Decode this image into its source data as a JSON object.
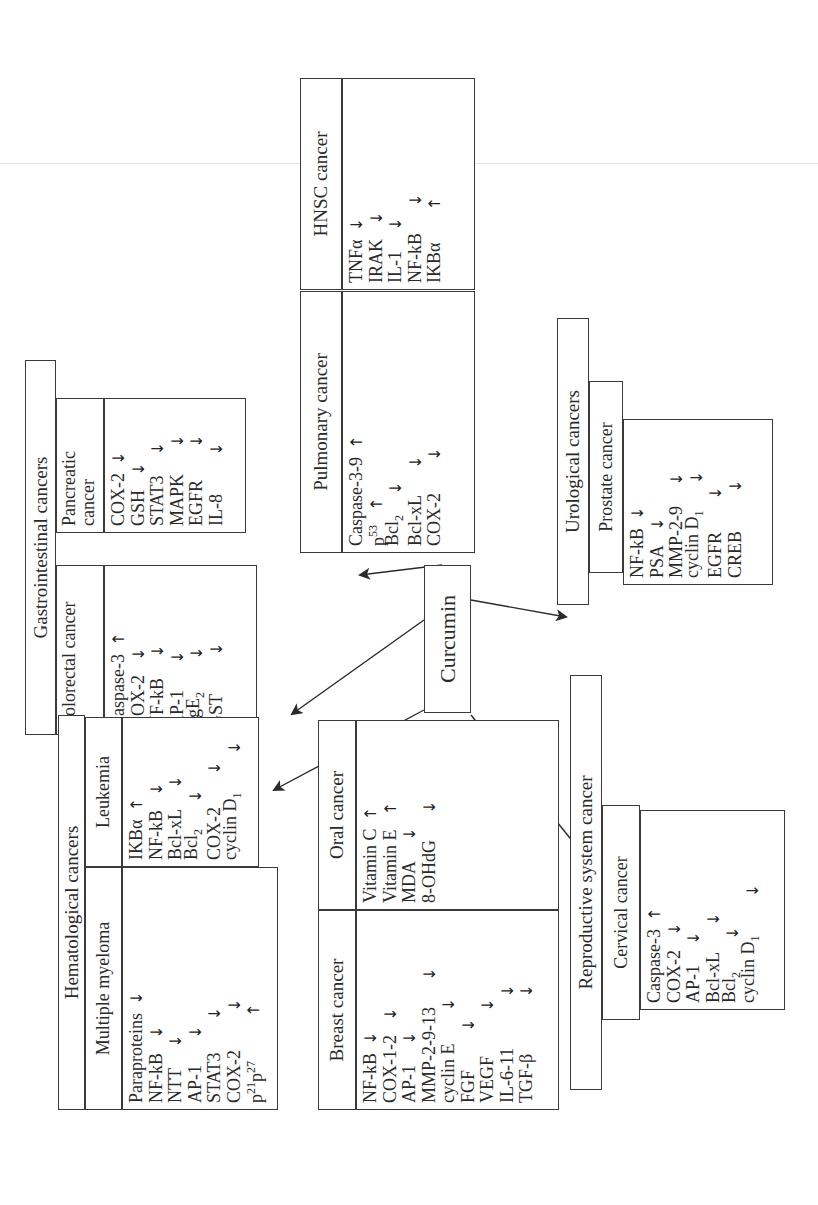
{
  "center": {
    "label": "Curcumin"
  },
  "groups": {
    "gastrointestinal": {
      "title": "Gastrointestinal cancers",
      "subgroups": [
        {
          "name": "Colorectal cancer",
          "items": [
            {
              "label": "Caspase-3",
              "effect": "up"
            },
            {
              "label": "COX-2",
              "effect": "down"
            },
            {
              "label": "NF-kB",
              "effect": "down"
            },
            {
              "label": "AP-1",
              "effect": "down"
            },
            {
              "label": "PgE2",
              "effect": "down"
            },
            {
              "label": "GST",
              "effect": "down"
            }
          ]
        },
        {
          "name": "Pancreatic cancer",
          "items": [
            {
              "label": "COX-2",
              "effect": "down"
            },
            {
              "label": "GSH",
              "effect": "down"
            },
            {
              "label": "STAT3",
              "effect": "down"
            },
            {
              "label": "MAPK",
              "effect": "down"
            },
            {
              "label": "EGFR",
              "effect": "down"
            },
            {
              "label": "IL-8",
              "effect": "down"
            }
          ]
        }
      ]
    },
    "pulmonary": {
      "title": "Pulmonary cancer",
      "items": [
        {
          "label": "Caspase-3-9",
          "effect": "up"
        },
        {
          "label": "p53",
          "effect": "up"
        },
        {
          "label": "Bcl2",
          "effect": "down"
        },
        {
          "label": "Bcl-xL",
          "effect": "down"
        },
        {
          "label": "COX-2",
          "effect": "down"
        }
      ]
    },
    "hnsc": {
      "title": "HNSC cancer",
      "items": [
        {
          "label": "TNFα",
          "effect": "down"
        },
        {
          "label": "IRAK",
          "effect": "down"
        },
        {
          "label": "IL-1",
          "effect": "down"
        },
        {
          "label": "NF-kB",
          "effect": "down"
        },
        {
          "label": "IKBα",
          "effect": "up"
        }
      ]
    },
    "urological": {
      "title": "Urological cancers",
      "subgroups": [
        {
          "name": "Prostate cancer",
          "items": [
            {
              "label": "NF-kB",
              "effect": "down"
            },
            {
              "label": "PSA",
              "effect": "down"
            },
            {
              "label": "MMP-2-9",
              "effect": "down"
            },
            {
              "label": "cyclin D1",
              "effect": "down"
            },
            {
              "label": "EGFR",
              "effect": "down"
            },
            {
              "label": "CREB",
              "effect": "down"
            }
          ]
        }
      ]
    },
    "hematological": {
      "title": "Hematological cancers",
      "subgroups": [
        {
          "name": "Multiple myeloma",
          "items": [
            {
              "label": "Paraproteins",
              "effect": "down"
            },
            {
              "label": "NF-kB",
              "effect": "down"
            },
            {
              "label": "NTT",
              "effect": "down"
            },
            {
              "label": "AP-1",
              "effect": "down"
            },
            {
              "label": "STAT3",
              "effect": "down"
            },
            {
              "label": "COX-2",
              "effect": "down"
            },
            {
              "label": "p21p27",
              "effect": "up"
            }
          ]
        },
        {
          "name": "Leukemia",
          "items": [
            {
              "label": "IKBα",
              "effect": "up"
            },
            {
              "label": "NF-kB",
              "effect": "down"
            },
            {
              "label": "Bcl-xL",
              "effect": "down"
            },
            {
              "label": "Bcl2",
              "effect": "down"
            },
            {
              "label": "COX-2",
              "effect": "down"
            },
            {
              "label": "cyclin D1",
              "effect": "down"
            }
          ]
        }
      ]
    },
    "breast": {
      "title": "Breast cancer",
      "items": [
        {
          "label": "NF-kB",
          "effect": "down"
        },
        {
          "label": "COX-1-2",
          "effect": "down"
        },
        {
          "label": "AP-1",
          "effect": "down"
        },
        {
          "label": "MMP-2-9-13",
          "effect": "down"
        },
        {
          "label": "cyclin E",
          "effect": "down"
        },
        {
          "label": "FGF",
          "effect": "down"
        },
        {
          "label": "VEGF",
          "effect": "down"
        },
        {
          "label": "IL-6-11",
          "effect": "down"
        },
        {
          "label": "TGF-β",
          "effect": "down"
        }
      ]
    },
    "oral": {
      "title": "Oral cancer",
      "items": [
        {
          "label": "Vitamin C",
          "effect": "up"
        },
        {
          "label": "Vitamin E",
          "effect": "up"
        },
        {
          "label": "MDA",
          "effect": "down"
        },
        {
          "label": "8-OHdG",
          "effect": "down"
        }
      ]
    },
    "reproductive": {
      "title": "Reproductive system cancer",
      "subgroups": [
        {
          "name": "Cervical cancer",
          "items": [
            {
              "label": "Caspase-3",
              "effect": "up"
            },
            {
              "label": "COX-2",
              "effect": "down"
            },
            {
              "label": "AP-1",
              "effect": "down"
            },
            {
              "label": "Bcl-xL",
              "effect": "down"
            },
            {
              "label": "Bcl2",
              "effect": "down"
            },
            {
              "label": "cyclin D1",
              "effect": "down"
            }
          ]
        }
      ]
    }
  },
  "legend": {
    "up_glyph": "↑",
    "down_glyph": "↓"
  },
  "colors": {
    "line": "#3a3a3a",
    "text": "#2a2a2a",
    "background": "#ffffff"
  }
}
